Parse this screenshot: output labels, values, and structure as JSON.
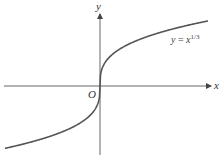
{
  "figure": {
    "axes": {
      "x_label": "x",
      "y_label": "y",
      "origin_label": "O"
    },
    "curve": {
      "label_lhs": "y",
      "label_eq": " = ",
      "label_base": "x",
      "label_exp": "1/3",
      "function": "y = x^(1/3)"
    },
    "colors": {
      "axis": "#555555",
      "curve": "#555555",
      "background": "#ffffff"
    }
  }
}
